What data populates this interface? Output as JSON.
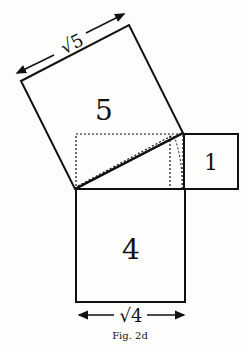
{
  "figure": {
    "caption": "Fig. 2d",
    "squares": [
      {
        "id": "square-5",
        "label": "5",
        "side_label": "√5"
      },
      {
        "id": "square-1",
        "label": "1"
      },
      {
        "id": "square-4",
        "label": "4",
        "side_label": "√4"
      }
    ],
    "colors": {
      "line": "#111111",
      "background": "#fdfdfb"
    }
  }
}
